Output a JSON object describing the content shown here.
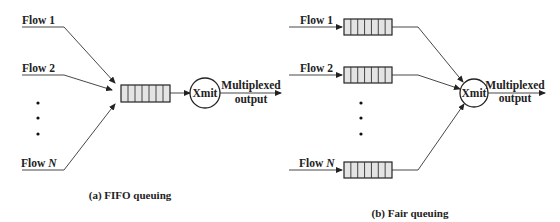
{
  "panel_a": {
    "caption": "(a) FIFO queuing",
    "flows": [
      {
        "label": "Flow ",
        "index": "1"
      },
      {
        "label": "Flow ",
        "index": "2"
      },
      {
        "label": "Flow ",
        "index": "N"
      }
    ],
    "transmitter": "Xmit",
    "output_line1": "Multiplexed",
    "output_line2": "output",
    "queue_cells": 7
  },
  "panel_b": {
    "caption": "(b) Fair queuing",
    "flows": [
      {
        "label": "Flow ",
        "index": "1"
      },
      {
        "label": "Flow ",
        "index": "2"
      },
      {
        "label": "Flow ",
        "index": "N"
      }
    ],
    "transmitter": "Xmit",
    "output_line1": "Multiplexed",
    "output_line2": "output",
    "queue_cells": 7
  },
  "colors": {
    "line": "#333333",
    "queue_fill": "#e4e4e4",
    "text": "#222222"
  }
}
